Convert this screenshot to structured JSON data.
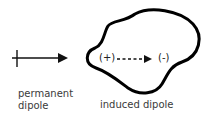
{
  "diagram": {
    "permanent_dipole": {
      "label_line1": "permanent",
      "label_line2": "dipole",
      "icon": "dipole-arrow-icon"
    },
    "induced_dipole": {
      "label": "induced dipole",
      "positive_charge": "(+)",
      "negative_charge": "(-)",
      "icon": "dashed-arrow-icon"
    },
    "colors": {
      "stroke": "#000000",
      "text": "#3a3a3a",
      "background": "#ffffff"
    }
  }
}
